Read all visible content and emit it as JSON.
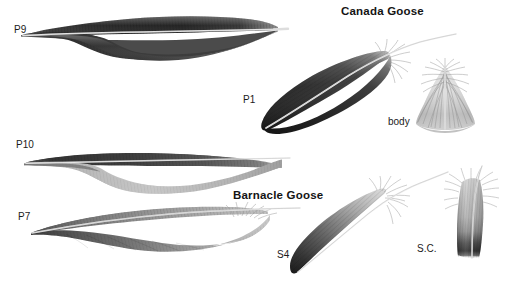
{
  "plate": {
    "width": 519,
    "height": 290,
    "background": "#ffffff",
    "kind": "feather-identification-plate"
  },
  "titles": {
    "canada_goose": "Canada Goose",
    "barnacle_goose": "Barnacle Goose"
  },
  "labels": {
    "p9": "P9",
    "p1": "P1",
    "body": "body",
    "p10": "P10",
    "p7": "P7",
    "s4": "S4",
    "sc": "S.C."
  },
  "colors": {
    "ink": "#141414",
    "label_ink": "#1b1b1b",
    "paper": "#ffffff",
    "vane_dark": "#2e2e2e",
    "vane_mid": "#6e6e6e",
    "vane_light": "#c9c9c9",
    "vane_pale": "#e4e4e4",
    "shaft": "#f2f2f2",
    "shaft_edge": "#8a8a8a",
    "down_grey": "#b8b8b8"
  },
  "specimens": [
    {
      "id": "p9",
      "species": "Canada Goose",
      "label": "P9",
      "type": "primary-flight-feather",
      "orientation": "horizontal",
      "tone": "dark",
      "notes": "long dark primary with emarginated (notched) outer vane"
    },
    {
      "id": "p1",
      "species": "Canada Goose",
      "label": "P1",
      "type": "primary-flight-feather",
      "orientation": "diagonal-up-right",
      "tone": "dark",
      "notes": "inner primary, uniformly dark with pale shaft"
    },
    {
      "id": "body",
      "species": "Canada Goose",
      "label": "body",
      "type": "body-contour-feather",
      "orientation": "upright",
      "tone": "pale-grey",
      "notes": "fluffy down-edged body feather"
    },
    {
      "id": "p10",
      "species": "Barnacle Goose",
      "label": "P10",
      "type": "primary-flight-feather",
      "orientation": "horizontal",
      "tone": "dark-outer-pale-inner",
      "notes": "outermost primary, dark outer vane and pale inner vane"
    },
    {
      "id": "p7",
      "species": "Barnacle Goose",
      "label": "P7",
      "type": "primary-flight-feather",
      "orientation": "horizontal",
      "tone": "graded-grey",
      "notes": "mid primary shading dark at tip to pale at base"
    },
    {
      "id": "s4",
      "species": "Barnacle Goose",
      "label": "S4",
      "type": "secondary-flight-feather",
      "orientation": "diagonal-up-right",
      "tone": "dark-tip",
      "notes": "secondary with blackish tip fading to grey"
    },
    {
      "id": "sc",
      "species": "Barnacle Goose",
      "label": "S.C.",
      "type": "secondary-covert-feather",
      "orientation": "upright",
      "tone": "grey-with-dark-band",
      "notes": "covert with dark subterminal band and white tip"
    }
  ]
}
